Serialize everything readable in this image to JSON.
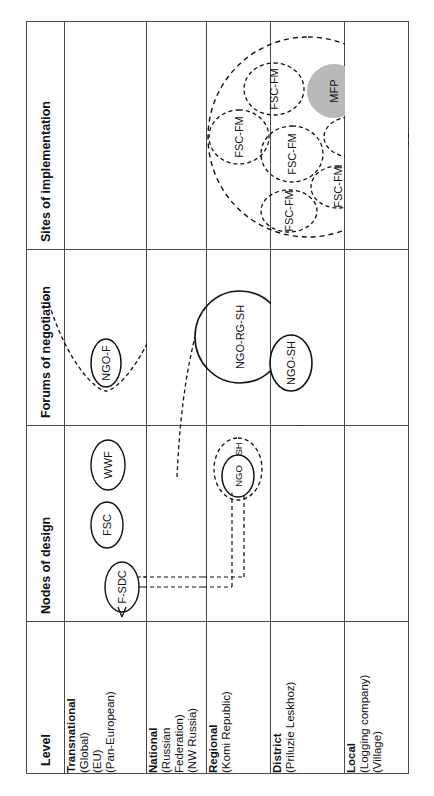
{
  "figure": {
    "orientation": "rotated-90ccw",
    "columns": [
      {
        "key": "level",
        "label": "Level"
      },
      {
        "key": "nodes",
        "label": "Nodes of design"
      },
      {
        "key": "forums",
        "label": "Forums of negotiation"
      },
      {
        "key": "sites",
        "label": "Sites of implementation"
      }
    ],
    "rows": [
      {
        "key": "transnational",
        "name": "Transnational",
        "sub": [
          "(Global)",
          "(EU)",
          "(Pan-European)"
        ]
      },
      {
        "key": "national",
        "name": "National",
        "sub": [
          "(Russian",
          "Federation)",
          "(NW Russia)"
        ]
      },
      {
        "key": "regional",
        "name": "Regional",
        "sub": [
          "(Komi Republic)"
        ]
      },
      {
        "key": "district",
        "name": "District",
        "sub": [
          "(Priluzie Leskhoz)"
        ]
      },
      {
        "key": "local",
        "name": "Local",
        "sub": [
          "(Logging company)",
          "(Village)"
        ]
      }
    ]
  },
  "nodes_of_design": {
    "transnational": [
      {
        "id": "f-sdc",
        "label": "F-SDC",
        "shape": "ellipse",
        "stroke": "solid",
        "has_inbound_arrow": true
      },
      {
        "id": "fsc",
        "label": "FSC",
        "shape": "ellipse",
        "stroke": "solid"
      },
      {
        "id": "wwf",
        "label": "WWF",
        "shape": "ellipse",
        "stroke": "solid"
      }
    ],
    "regional": [
      {
        "id": "ngo-sh-group",
        "label": "SH",
        "shape": "ellipse",
        "stroke": "dashed"
      },
      {
        "id": "ngo",
        "label": "NGO",
        "shape": "ellipse",
        "stroke": "solid"
      }
    ],
    "connector": {
      "from": "f-sdc",
      "to": "ngo",
      "style": "double-dashed-line"
    }
  },
  "forums_of_negotiation": {
    "transnational": [
      {
        "id": "ngo-f-arc",
        "label": "",
        "shape": "arc",
        "stroke": "dashed"
      },
      {
        "id": "ngo-f",
        "label": "NGO-F",
        "shape": "ellipse",
        "stroke": "solid"
      }
    ],
    "regional": [
      {
        "id": "ngo-rg-sh",
        "label": "NGO-RG-SH",
        "shape": "ellipse",
        "stroke": "solid"
      },
      {
        "id": "forum-arc",
        "label": "",
        "shape": "arc",
        "stroke": "dashed"
      }
    ],
    "district": [
      {
        "id": "ngo-sh",
        "label": "NGO-SH",
        "shape": "ellipse",
        "stroke": "solid"
      }
    ]
  },
  "sites_of_implementation": {
    "district": {
      "container": {
        "id": "sites-container",
        "shape": "circle",
        "stroke": "dashed"
      },
      "items": [
        {
          "id": "fsc-fm-1",
          "label": "FSC-FM",
          "shape": "ellipse",
          "stroke": "dashed",
          "fill": "none"
        },
        {
          "id": "fsc-fm-2",
          "label": "FSC-FM",
          "shape": "ellipse",
          "stroke": "dashed",
          "fill": "none"
        },
        {
          "id": "fsc-fm-3",
          "label": "FSC-FM",
          "shape": "ellipse",
          "stroke": "dashed",
          "fill": "none"
        },
        {
          "id": "fsc-fm-4",
          "label": "FSC-FM",
          "shape": "ellipse",
          "stroke": "dashed",
          "fill": "none"
        },
        {
          "id": "fsc-fm-5",
          "label": "FSC-FM",
          "shape": "ellipse",
          "stroke": "dashed",
          "fill": "none"
        },
        {
          "id": "fsc-fm-6",
          "label": "FSC-FM",
          "shape": "ellipse",
          "stroke": "dashed",
          "fill": "none"
        },
        {
          "id": "mfp",
          "label": "MFP",
          "shape": "circle",
          "stroke": "none",
          "fill": "#b9b9b9"
        }
      ]
    }
  },
  "colors": {
    "line": "#4a4a4a",
    "node_stroke": "#111111",
    "mfp_fill": "#b9b9b9",
    "text": "#111111",
    "background": "#ffffff"
  }
}
